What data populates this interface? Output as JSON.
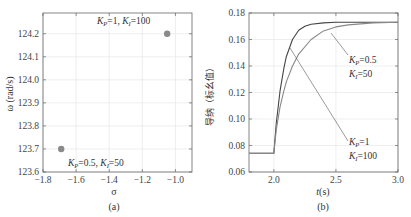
{
  "chart_data": [
    {
      "panel": "(a)",
      "type": "scatter",
      "title": "",
      "xlabel": "σ",
      "ylabel": "ω (rad/s)",
      "xlim": [
        -1.8,
        -0.9
      ],
      "ylim": [
        123.6,
        124.29
      ],
      "xticks": [
        -1.8,
        -1.6,
        -1.4,
        -1.2,
        -1.0
      ],
      "xtick_labels": [
        "−1.8",
        "−1.6",
        "−1.4",
        "−1.2",
        "−1.0"
      ],
      "yticks": [
        123.6,
        123.7,
        123.8,
        123.9,
        124.0,
        124.1,
        124.2
      ],
      "ytick_labels": [
        "123.6",
        "123.7",
        "123.8",
        "123.9",
        "124.0",
        "124.1",
        "124.2"
      ],
      "grid": true,
      "points": [
        {
          "x": -1.69,
          "y": 123.7,
          "label": "K_P=0.5, K_I=50"
        },
        {
          "x": -1.05,
          "y": 124.2,
          "label": "K_P=1, K_I=100"
        }
      ],
      "marker_color": "#8a8a8a"
    },
    {
      "panel": "(b)",
      "type": "line",
      "title": "",
      "xlabel": "t(s)",
      "ylabel": "导纳（标幺值）",
      "xlim": [
        1.8,
        3.0
      ],
      "ylim": [
        0.06,
        0.18
      ],
      "xticks": [
        2.0,
        2.5,
        3.0
      ],
      "xtick_labels": [
        "2.0",
        "2.5",
        "3.0"
      ],
      "yticks": [
        0.06,
        0.08,
        0.1,
        0.12,
        0.14,
        0.16,
        0.18
      ],
      "ytick_labels": [
        "0.06",
        "0.08",
        "0.10",
        "0.12",
        "0.14",
        "0.16",
        "0.18"
      ],
      "grid": true,
      "series": [
        {
          "name": "K_P=1, K_I=100",
          "color": "#444444",
          "x": [
            1.8,
            2.0,
            2.02,
            2.05,
            2.08,
            2.1,
            2.15,
            2.2,
            2.25,
            2.3,
            2.4,
            2.5,
            2.7,
            3.0
          ],
          "y": [
            0.074,
            0.074,
            0.097,
            0.121,
            0.138,
            0.147,
            0.16,
            0.167,
            0.17,
            0.1715,
            0.1725,
            0.173,
            0.173,
            0.173
          ]
        },
        {
          "name": "K_P=0.5, K_I=50",
          "color": "#888888",
          "x": [
            1.8,
            2.0,
            2.02,
            2.05,
            2.08,
            2.1,
            2.15,
            2.2,
            2.3,
            2.4,
            2.5,
            2.6,
            2.8,
            3.0
          ],
          "y": [
            0.074,
            0.074,
            0.092,
            0.109,
            0.121,
            0.128,
            0.14,
            0.149,
            0.16,
            0.1665,
            0.1695,
            0.171,
            0.1725,
            0.173
          ]
        }
      ],
      "annotations": [
        {
          "text": [
            "K_P=0.5",
            "K_I=50"
          ],
          "points_to": {
            "x": 2.42,
            "y": 0.165
          }
        },
        {
          "text": [
            "K_P=1",
            "K_I=100"
          ],
          "points_to": {
            "x": 2.12,
            "y": 0.152
          }
        }
      ]
    }
  ],
  "panels": {
    "a": {
      "caption": "(a)",
      "xlabel": "σ",
      "ylabel": "ω (rad/s)",
      "ann1": {
        "k": "K",
        "ksub": "P",
        "v": "=1, ",
        "k2": "K",
        "k2sub": "I",
        "v2": "=100"
      },
      "ann2": {
        "k": "K",
        "ksub": "P",
        "v": "=0.5, ",
        "k2": "K",
        "k2sub": "I",
        "v2": "=50"
      }
    },
    "b": {
      "caption": "(b)",
      "xlabel_italic": "t",
      "xlabel_rest": "(s)",
      "ylabel": "导纳（标幺值）",
      "ann1": {
        "k": "K",
        "ksub": "P",
        "v": "=0.5"
      },
      "ann1b": {
        "k": "K",
        "ksub": "I",
        "v": "=50"
      },
      "ann2": {
        "k": "K",
        "ksub": "P",
        "v": "=1"
      },
      "ann2b": {
        "k": "K",
        "ksub": "I",
        "v": "=100"
      }
    }
  }
}
